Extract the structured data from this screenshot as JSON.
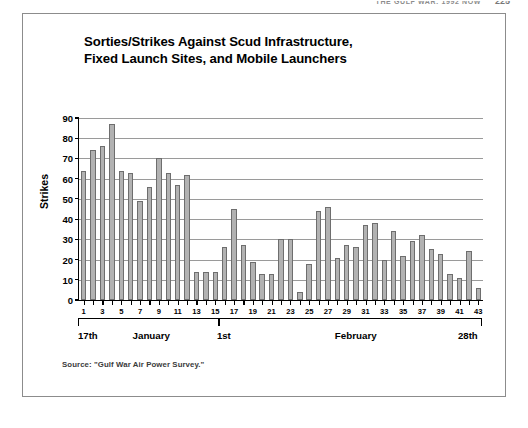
{
  "running_head": {
    "title": "THE GULF WAR: 1992 NOW",
    "page_number": "225"
  },
  "figure": {
    "source_note": "Source: \"Gulf War Air Power Survey.\"",
    "axis_brackets": [
      {
        "label": "17th",
        "align": "start"
      },
      {
        "label": "1st",
        "align": "mid"
      },
      {
        "label": "28th",
        "align": "end"
      }
    ],
    "month_labels": [
      "January",
      "February"
    ]
  },
  "chart_data": {
    "type": "bar",
    "title": "Sorties/Strikes Against Scud Infrastructure, Fixed Launch Sites, and Mobile Launchers",
    "title_line_1": "Sorties/Strikes Against Scud Infrastructure,",
    "title_line_2": "Fixed Launch Sites, and Mobile Launchers",
    "xlabel": "",
    "ylabel": "Strikes",
    "ylim": [
      0,
      90
    ],
    "ytick_step": 10,
    "yticks": [
      0,
      10,
      20,
      30,
      40,
      50,
      60,
      70,
      80,
      90
    ],
    "grid": true,
    "legend": "none",
    "xlim": [
      1,
      43
    ],
    "xtick_labels": [
      "1",
      "3",
      "5",
      "7",
      "9",
      "11",
      "13",
      "15",
      "17",
      "19",
      "21",
      "23",
      "25",
      "27",
      "29",
      "31",
      "33",
      "35",
      "37",
      "39",
      "41",
      "43"
    ],
    "categories": [
      1,
      2,
      3,
      4,
      5,
      6,
      7,
      8,
      9,
      10,
      11,
      12,
      13,
      14,
      15,
      16,
      17,
      18,
      19,
      20,
      21,
      22,
      23,
      24,
      25,
      26,
      27,
      28,
      29,
      30,
      31,
      32,
      33,
      34,
      35,
      36,
      37,
      38,
      39,
      40,
      41,
      42,
      43
    ],
    "values": [
      64,
      74,
      76,
      87,
      64,
      63,
      49,
      56,
      70,
      63,
      57,
      62,
      14,
      14,
      14,
      26,
      45,
      27,
      19,
      13,
      13,
      30,
      30,
      4,
      18,
      44,
      46,
      21,
      27,
      26,
      37,
      38,
      20,
      34,
      22,
      29,
      32,
      25,
      23,
      13,
      11,
      24,
      6
    ],
    "bar_color": "#b2b2b2",
    "bar_edge_color": "#6e6e6e",
    "date_range_start": "17th January",
    "date_range_end": "28th February"
  }
}
